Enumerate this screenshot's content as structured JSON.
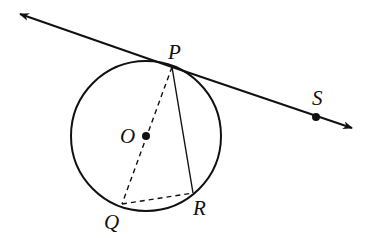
{
  "diagram": {
    "labels": {
      "P": "P",
      "S": "S",
      "O": "O",
      "Q": "Q",
      "R": "R"
    },
    "elements": [
      "tangent line through P and S",
      "circle centered at O",
      "dashed diameter PQ",
      "chord PR",
      "dashed chord QR"
    ],
    "colors": {
      "stroke": "#111111",
      "background": "#ffffff"
    }
  }
}
